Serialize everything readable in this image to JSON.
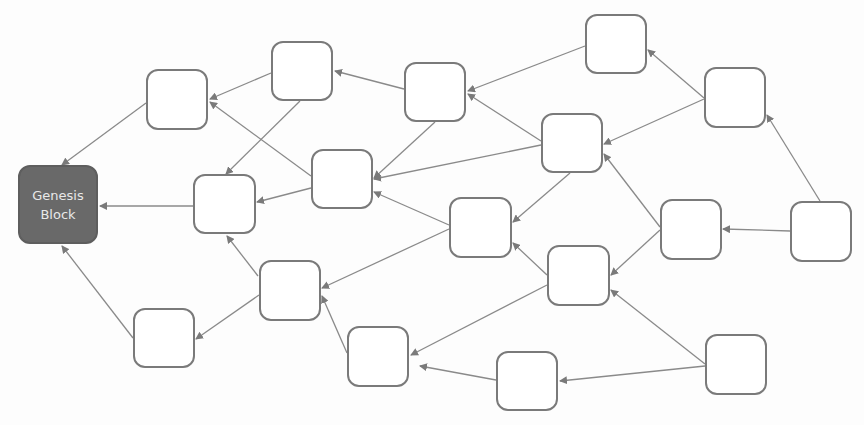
{
  "diagram": {
    "colors": {
      "genesis_fill": "#696969",
      "node_border": "#7a7a7a",
      "edge": "#8a8a8a",
      "arrow": "#7a7a7a",
      "genesis_text": "#e8e8e8"
    },
    "genesis": {
      "line1": "Genesis",
      "line2": "Block"
    },
    "nodes": [
      {
        "id": "genesis",
        "x": 18,
        "y": 165,
        "w": 80,
        "h": 79
      },
      {
        "id": "A",
        "x": 146,
        "y": 69,
        "w": 62,
        "h": 61
      },
      {
        "id": "B",
        "x": 271,
        "y": 41,
        "w": 62,
        "h": 60
      },
      {
        "id": "C",
        "x": 404,
        "y": 62,
        "w": 62,
        "h": 60
      },
      {
        "id": "D",
        "x": 585,
        "y": 14,
        "w": 62,
        "h": 60
      },
      {
        "id": "E",
        "x": 704,
        "y": 67,
        "w": 62,
        "h": 61
      },
      {
        "id": "F",
        "x": 193,
        "y": 174,
        "w": 63,
        "h": 60
      },
      {
        "id": "G",
        "x": 311,
        "y": 149,
        "w": 62,
        "h": 60
      },
      {
        "id": "H",
        "x": 541,
        "y": 113,
        "w": 62,
        "h": 60
      },
      {
        "id": "I",
        "x": 449,
        "y": 197,
        "w": 63,
        "h": 61
      },
      {
        "id": "J",
        "x": 660,
        "y": 199,
        "w": 62,
        "h": 61
      },
      {
        "id": "K",
        "x": 790,
        "y": 201,
        "w": 62,
        "h": 61
      },
      {
        "id": "L",
        "x": 259,
        "y": 260,
        "w": 62,
        "h": 61
      },
      {
        "id": "M",
        "x": 547,
        "y": 245,
        "w": 63,
        "h": 61
      },
      {
        "id": "N",
        "x": 133,
        "y": 308,
        "w": 62,
        "h": 60
      },
      {
        "id": "O",
        "x": 347,
        "y": 326,
        "w": 62,
        "h": 61
      },
      {
        "id": "P",
        "x": 496,
        "y": 351,
        "w": 62,
        "h": 60
      },
      {
        "id": "Q",
        "x": 705,
        "y": 334,
        "w": 62,
        "h": 61
      }
    ],
    "edges": [
      {
        "from": "A",
        "to": "genesis",
        "x1": 146,
        "y1": 103,
        "x2": 62,
        "y2": 165
      },
      {
        "from": "F",
        "to": "genesis",
        "x1": 193,
        "y1": 206,
        "x2": 100,
        "y2": 206
      },
      {
        "from": "N",
        "to": "genesis",
        "x1": 133,
        "y1": 338,
        "x2": 62,
        "y2": 246
      },
      {
        "from": "B",
        "to": "A",
        "x1": 271,
        "y1": 73,
        "x2": 210,
        "y2": 99
      },
      {
        "from": "G",
        "to": "A",
        "x1": 311,
        "y1": 176,
        "x2": 210,
        "y2": 102
      },
      {
        "from": "B",
        "to": "F",
        "x1": 300,
        "y1": 101,
        "x2": 226,
        "y2": 174
      },
      {
        "from": "G",
        "to": "F",
        "x1": 311,
        "y1": 188,
        "x2": 257,
        "y2": 202
      },
      {
        "from": "L",
        "to": "F",
        "x1": 258,
        "y1": 276,
        "x2": 227,
        "y2": 236
      },
      {
        "from": "C",
        "to": "B",
        "x1": 404,
        "y1": 89,
        "x2": 335,
        "y2": 71
      },
      {
        "from": "D",
        "to": "C",
        "x1": 585,
        "y1": 46,
        "x2": 468,
        "y2": 91
      },
      {
        "from": "H",
        "to": "C",
        "x1": 541,
        "y1": 141,
        "x2": 468,
        "y2": 94
      },
      {
        "from": "E",
        "to": "D",
        "x1": 704,
        "y1": 98,
        "x2": 648,
        "y2": 50
      },
      {
        "from": "C",
        "to": "G",
        "x1": 435,
        "y1": 122,
        "x2": 374,
        "y2": 178
      },
      {
        "from": "H",
        "to": "G",
        "x1": 541,
        "y1": 145,
        "x2": 374,
        "y2": 179
      },
      {
        "from": "I",
        "to": "G",
        "x1": 449,
        "y1": 225,
        "x2": 374,
        "y2": 192
      },
      {
        "from": "E",
        "to": "H",
        "x1": 704,
        "y1": 99,
        "x2": 604,
        "y2": 144
      },
      {
        "from": "K",
        "to": "E",
        "x1": 820,
        "y1": 201,
        "x2": 767,
        "y2": 115
      },
      {
        "from": "H",
        "to": "I",
        "x1": 570,
        "y1": 173,
        "x2": 513,
        "y2": 222
      },
      {
        "from": "M",
        "to": "I",
        "x1": 547,
        "y1": 275,
        "x2": 513,
        "y2": 243
      },
      {
        "from": "J",
        "to": "H",
        "x1": 660,
        "y1": 227,
        "x2": 604,
        "y2": 154
      },
      {
        "from": "K",
        "to": "J",
        "x1": 790,
        "y1": 231,
        "x2": 723,
        "y2": 229
      },
      {
        "from": "J",
        "to": "M",
        "x1": 660,
        "y1": 230,
        "x2": 611,
        "y2": 275
      },
      {
        "from": "Q",
        "to": "M",
        "x1": 705,
        "y1": 364,
        "x2": 611,
        "y2": 290
      },
      {
        "from": "I",
        "to": "L",
        "x1": 449,
        "y1": 229,
        "x2": 322,
        "y2": 288
      },
      {
        "from": "O",
        "to": "L",
        "x1": 347,
        "y1": 353,
        "x2": 322,
        "y2": 296
      },
      {
        "from": "L",
        "to": "N",
        "x1": 259,
        "y1": 295,
        "x2": 196,
        "y2": 339
      },
      {
        "from": "M",
        "to": "O",
        "x1": 547,
        "y1": 285,
        "x2": 411,
        "y2": 355
      },
      {
        "from": "P",
        "to": "O",
        "x1": 496,
        "y1": 380,
        "x2": 420,
        "y2": 366
      },
      {
        "from": "Q",
        "to": "P",
        "x1": 705,
        "y1": 366,
        "x2": 560,
        "y2": 381
      }
    ]
  }
}
